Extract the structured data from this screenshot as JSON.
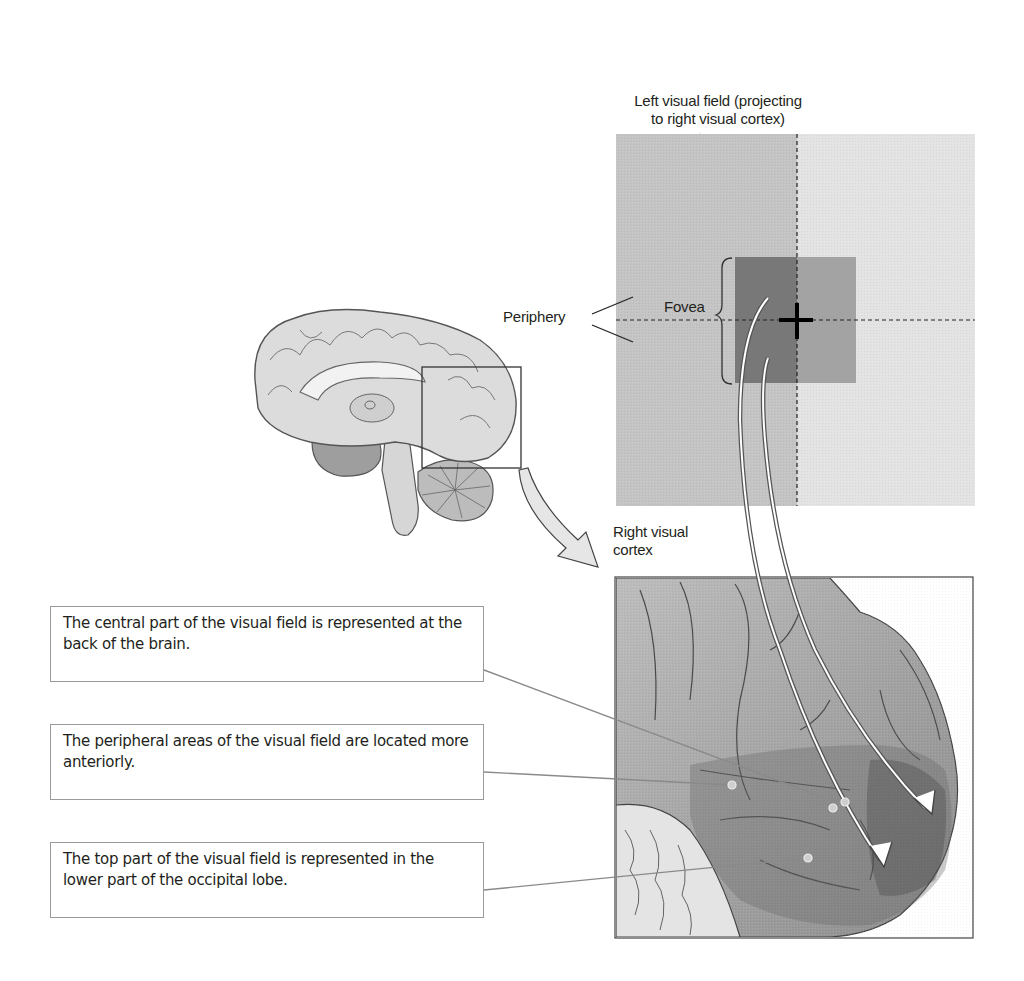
{
  "visual_field": {
    "title_line1": "Left visual field (projecting",
    "title_line2": "to right visual cortex)",
    "periphery_label": "Periphery",
    "fovea_label": "Fovea",
    "colors": {
      "left_field": "#c4c4c4",
      "right_field": "#e2e2e2",
      "fovea_left": "#7a7a7a",
      "fovea_right": "#a4a4a4",
      "fixation_cross": "#000000"
    }
  },
  "brain": {
    "inset_box_label": "",
    "colors": {
      "cortex": "#d9d9d9",
      "outline": "#555555",
      "arrow_fill": "#e6e6e6"
    }
  },
  "cortex_view": {
    "title_line1": "Right visual",
    "title_line2": "cortex"
  },
  "callouts": [
    {
      "text": "The central part of the visual field is represented at the back of the brain."
    },
    {
      "text": "The peripheral areas of the visual field are located more anteriorly."
    },
    {
      "text": "The top part of the visual field is represented in the lower part of the occipital lobe."
    }
  ]
}
